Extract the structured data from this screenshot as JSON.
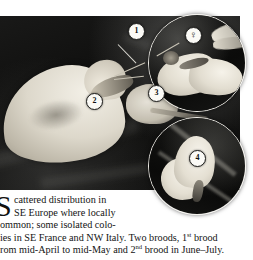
{
  "page": {
    "kind": "field-guide-plate",
    "background_color": "#ffffff"
  },
  "plate": {
    "caption_markers": [
      {
        "id": "1",
        "label": "1",
        "target": "forewing-apex"
      },
      {
        "id": "2",
        "label": "2",
        "target": "hindwing-underside"
      },
      {
        "id": "3",
        "label": "3",
        "target": "wing-venation"
      },
      {
        "id": "4",
        "label": "4",
        "target": "closed-wing-profile"
      }
    ],
    "sex_badge": {
      "label": "♀",
      "name": "female-symbol"
    },
    "insets": [
      {
        "id": "inset-top",
        "subject": "open-winged-butterfly"
      },
      {
        "id": "inset-bottom",
        "subject": "closed-winged-butterfly"
      }
    ],
    "subject": "white-butterfly-on-flower"
  },
  "body": {
    "dropcap": "S",
    "lines": [
      "cattered distribution in",
      "SE Europe where locally",
      "ommon; some isolated colo-",
      "ies in SE France and NW Italy. Two broods, 1",
      "rom mid-April to mid-May and 2"
    ],
    "line4_sup": "st",
    "line4_tail": " brood",
    "line5_sup": "nd",
    "line5_tail": " brood in June–July.",
    "full_text": "Scattered distribution in SE Europe where locally common; some isolated colonies in SE France and NW Italy. Two broods, 1st brood from mid-April to mid-May and 2nd brood in June–July."
  }
}
